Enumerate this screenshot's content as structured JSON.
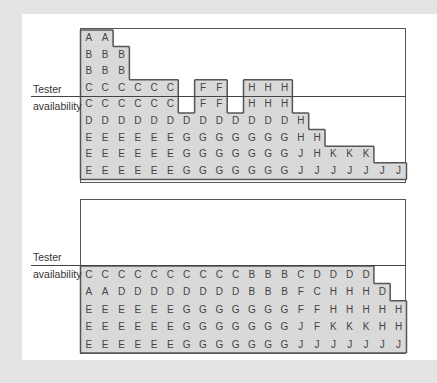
{
  "labels": {
    "tester": "Tester",
    "availability": "availability"
  },
  "colors": {
    "background": "#e4e4e4",
    "panel": "#ffffff",
    "fill": "#d9d9d9",
    "border": "#555555",
    "text": "#444444"
  },
  "top_diagram": {
    "columns": 20,
    "rows": [
      [
        "A",
        "A",
        "",
        "",
        "",
        "",
        "",
        "",
        "",
        "",
        "",
        "",
        "",
        "",
        "",
        "",
        "",
        "",
        "",
        ""
      ],
      [
        "B",
        "B",
        "B",
        "",
        "",
        "",
        "",
        "",
        "",
        "",
        "",
        "",
        "",
        "",
        "",
        "",
        "",
        "",
        "",
        ""
      ],
      [
        "B",
        "B",
        "B",
        "",
        "",
        "",
        "",
        "",
        "",
        "",
        "",
        "",
        "",
        "",
        "",
        "",
        "",
        "",
        "",
        ""
      ],
      [
        "C",
        "C",
        "C",
        "C",
        "C",
        "C",
        "",
        "F",
        "F",
        "",
        "H",
        "H",
        "H",
        "",
        "",
        "",
        "",
        "",
        "",
        ""
      ],
      [
        "C",
        "C",
        "C",
        "C",
        "C",
        "C",
        "",
        "F",
        "F",
        "",
        "H",
        "H",
        "H",
        "",
        "",
        "",
        "",
        "",
        "",
        ""
      ],
      [
        "D",
        "D",
        "D",
        "D",
        "D",
        "D",
        "D",
        "D",
        "D",
        "D",
        "D",
        "D",
        "D",
        "H",
        "",
        "",
        "",
        "",
        "",
        ""
      ],
      [
        "E",
        "E",
        "E",
        "E",
        "E",
        "E",
        "G",
        "G",
        "G",
        "G",
        "G",
        "G",
        "G",
        "H",
        "H",
        "",
        "",
        "",
        "",
        ""
      ],
      [
        "E",
        "E",
        "E",
        "E",
        "E",
        "E",
        "G",
        "G",
        "G",
        "G",
        "G",
        "G",
        "G",
        "J",
        "H",
        "K",
        "K",
        "K",
        "",
        ""
      ],
      [
        "E",
        "E",
        "E",
        "E",
        "E",
        "E",
        "G",
        "G",
        "G",
        "G",
        "G",
        "G",
        "G",
        "J",
        "J",
        "J",
        "J",
        "J",
        "J",
        "J"
      ]
    ],
    "tester_line_after_row": 4
  },
  "bottom_diagram": {
    "columns": 20,
    "rows": [
      [
        "C",
        "C",
        "C",
        "C",
        "C",
        "C",
        "C",
        "C",
        "C",
        "C",
        "B",
        "B",
        "B",
        "C",
        "D",
        "D",
        "D",
        "D",
        "",
        ""
      ],
      [
        "A",
        "A",
        "D",
        "D",
        "D",
        "D",
        "D",
        "D",
        "D",
        "D",
        "B",
        "B",
        "B",
        "F",
        "C",
        "H",
        "H",
        "H",
        "D",
        ""
      ],
      [
        "E",
        "E",
        "E",
        "E",
        "E",
        "E",
        "G",
        "G",
        "G",
        "G",
        "G",
        "G",
        "G",
        "F",
        "F",
        "H",
        "H",
        "H",
        "H",
        "H"
      ],
      [
        "E",
        "E",
        "E",
        "E",
        "E",
        "E",
        "G",
        "G",
        "G",
        "G",
        "G",
        "G",
        "G",
        "J",
        "F",
        "K",
        "K",
        "K",
        "H",
        "H"
      ],
      [
        "E",
        "E",
        "E",
        "E",
        "E",
        "E",
        "G",
        "G",
        "G",
        "G",
        "G",
        "G",
        "G",
        "J",
        "J",
        "J",
        "J",
        "J",
        "J",
        "J"
      ]
    ],
    "tester_line_after_row": 0
  }
}
